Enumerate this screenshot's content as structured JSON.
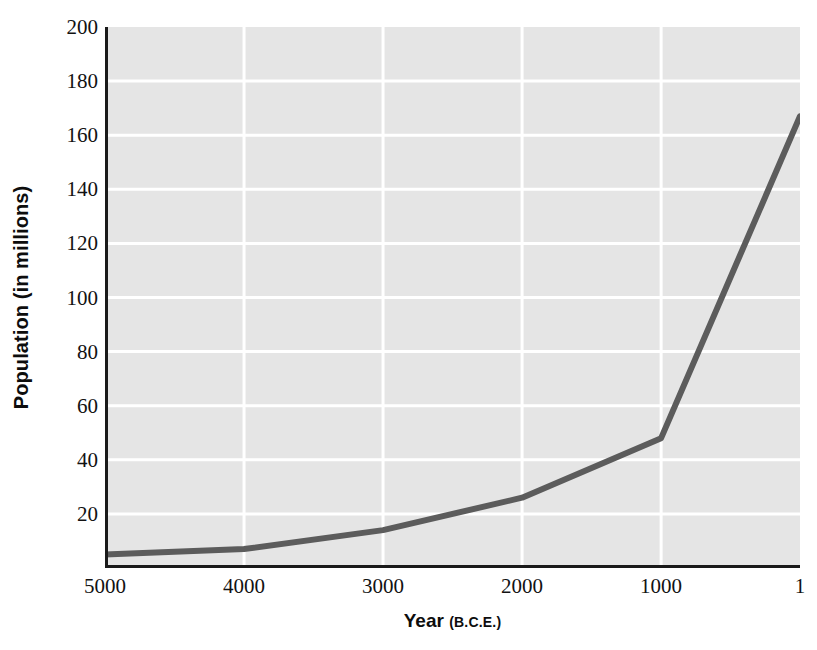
{
  "chart_data": {
    "type": "line",
    "title": "",
    "subtitle": "",
    "xlabel": "Year",
    "xlabel_suffix": "(B.C.E.)",
    "ylabel": "Population (in millions)",
    "x": [
      5000,
      4000,
      3000,
      2000,
      1000,
      1
    ],
    "values": [
      5,
      7,
      14,
      26,
      48,
      167
    ],
    "series": [
      {
        "name": "World population",
        "values": [
          5,
          7,
          14,
          26,
          48,
          167
        ]
      }
    ],
    "x_tick_labels": [
      "5000",
      "4000",
      "3000",
      "2000",
      "1000",
      "1"
    ],
    "y_tick_labels": [
      "20",
      "40",
      "60",
      "80",
      "100",
      "120",
      "140",
      "160",
      "180",
      "200"
    ],
    "y_ticks": [
      20,
      40,
      60,
      80,
      100,
      120,
      140,
      160,
      180,
      200
    ],
    "xlim": [
      5000,
      1
    ],
    "ylim": [
      0,
      200
    ],
    "x_axis_reversed": true,
    "grid": true,
    "grid_color": "#ffffff",
    "legend": false,
    "legend_position": "none",
    "plot_background": "#e5e5e5",
    "line_color": "#5c5c5c",
    "line_width": 6,
    "axis_color": "#1a1a1a",
    "page_background": "#ffffff"
  }
}
